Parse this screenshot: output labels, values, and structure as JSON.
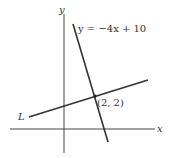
{
  "diagram": {
    "axes": {
      "x_label": "x",
      "y_label": "y"
    },
    "lines": [
      {
        "name": "steep-line",
        "label": "y = −4x + 10",
        "equation": "y = -4x + 10"
      },
      {
        "name": "line-L",
        "label": "L"
      }
    ],
    "point": {
      "label": "(2, 2)",
      "x": 2,
      "y": 2
    },
    "colors": {
      "stroke": "#333333",
      "background": "#ffffff"
    }
  }
}
